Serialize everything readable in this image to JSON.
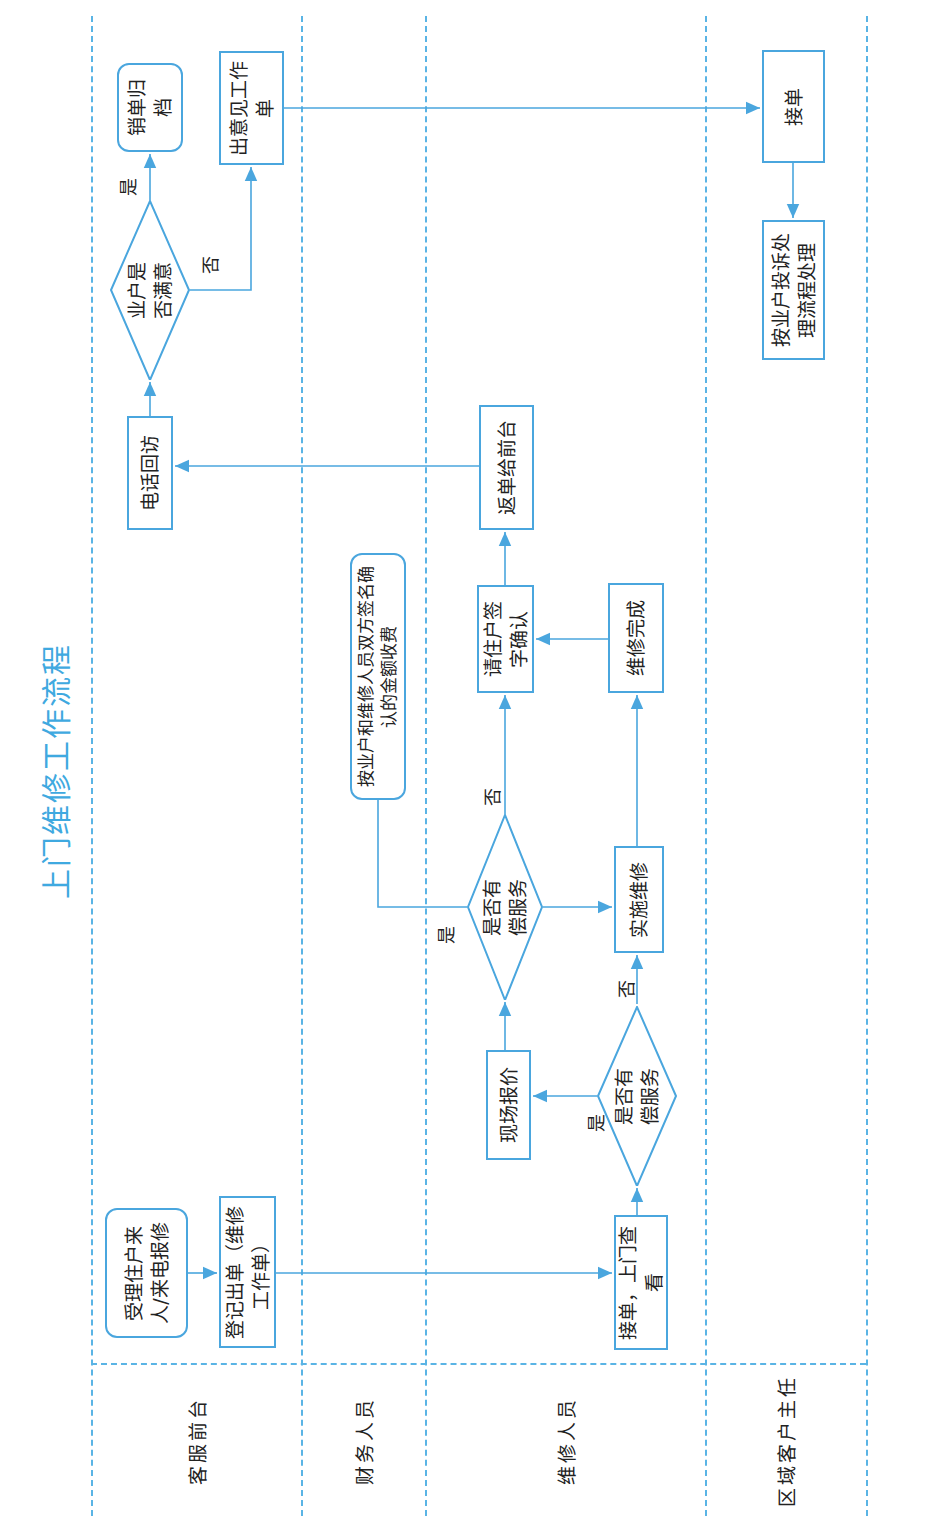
{
  "title": "上门维修工作流程",
  "lanes": [
    {
      "label": "客服前台"
    },
    {
      "label": "财务人员"
    },
    {
      "label": "维修人员"
    },
    {
      "label": "区域客户主任"
    }
  ],
  "nodes": {
    "accept_report": "受理住户来人/来电报修",
    "register_order": "登记出单（维修工作单）",
    "receive_inspect": "接单，上门查看",
    "paid_service_q1": "是否有偿服务",
    "onsite_quote": "现场报价",
    "paid_service_q2": "是否有偿服务",
    "implement_repair": "实施维修",
    "charge_by_signed": "按业户和维修人员双方签名确认的金额收费",
    "repair_done": "维修完成",
    "resident_sign": "请住户签字确认",
    "return_to_desk": "返单给前台",
    "phone_followup": "电话回访",
    "satisfied_q": "业户是否满意",
    "close_archive": "销单归档",
    "issue_feedback": "出意见工作单",
    "receive_order": "接单",
    "complaint_process": "按业户投诉处理流程处理"
  },
  "edge_labels": {
    "q1_yes": "是",
    "q1_no": "否",
    "q2_yes": "是",
    "q2_no": "否",
    "sat_yes": "是",
    "sat_no": "否"
  },
  "colors": {
    "accent": "#4aa6de",
    "title": "#3fa9e0",
    "divider": "#5ab4e5"
  }
}
